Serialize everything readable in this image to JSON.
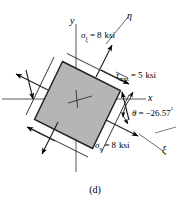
{
  "figure": {
    "caption": "(d)",
    "type": "stress-element-diagram",
    "background": "#ffffff",
    "element_fill": "#b5b5b5",
    "element_stroke": "#000000",
    "axes": {
      "x_label": "x",
      "y_label": "y",
      "eta_label": "η",
      "xi_label": "ξ"
    },
    "labels": {
      "sigma_xi": {
        "symbol": "σ",
        "subscript": "ξ",
        "equals": "=",
        "value": "8",
        "unit": "ksi",
        "text": "σξ = 8 ksi"
      },
      "sigma_eta": {
        "symbol": "σ",
        "subscript": "η",
        "equals": "=",
        "value": "8",
        "unit": "ksi",
        "text": "ση = 8 ksi"
      },
      "tau_max": {
        "symbol": "τ",
        "subscript": "max",
        "equals": "=",
        "value": "5",
        "unit": "ksi",
        "text": "τmax = 5 ksi"
      },
      "theta": {
        "symbol": "θ",
        "equals": "=",
        "value": "−26.57",
        "unit": "°",
        "text": "θ = −26.57°"
      }
    }
  }
}
